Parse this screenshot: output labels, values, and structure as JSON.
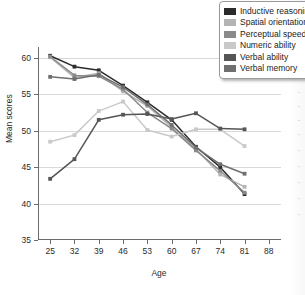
{
  "chart_data": {
    "type": "line",
    "title": "",
    "xlabel": "Age",
    "ylabel": "Mean scores",
    "xlim": [
      21.5,
      91.5
    ],
    "ylim": [
      35,
      61.5
    ],
    "ytick_values": [
      35,
      40,
      45,
      50,
      55,
      60
    ],
    "ytick_labels": [
      "35",
      "40",
      "45",
      "50",
      "55",
      "60"
    ],
    "xtick_values": [
      25,
      32,
      39,
      46,
      53,
      60,
      67,
      74,
      81,
      88
    ],
    "xtick_labels": [
      "25",
      "32",
      "39",
      "46",
      "53",
      "60",
      "67",
      "74",
      "81",
      "88"
    ],
    "x": [
      25,
      32,
      39,
      46,
      53,
      60,
      67,
      74,
      81
    ],
    "grid": "horizontal",
    "legend_position": "top-right",
    "markers": "filled-square",
    "series": [
      {
        "name": "Inductive reasoning",
        "color": "#2b2b2b",
        "values": [
          60.3,
          58.8,
          58.3,
          56.2,
          53.9,
          51.5,
          47.8,
          45.0,
          41.3
        ]
      },
      {
        "name": "Spatial orientation",
        "color": "#b4b4b4",
        "values": [
          60.1,
          57.3,
          57.9,
          55.4,
          53.4,
          50.5,
          47.5,
          44.0,
          42.3
        ]
      },
      {
        "name": "Perceptual speed",
        "color": "#8a8a8a",
        "values": [
          60.2,
          57.6,
          57.5,
          55.7,
          52.5,
          50.3,
          47.3,
          44.5,
          41.5
        ]
      },
      {
        "name": "Numeric ability",
        "color": "#c9c9c9",
        "values": [
          48.5,
          49.4,
          52.7,
          54.0,
          50.1,
          49.2,
          50.2,
          50.2,
          47.9
        ]
      },
      {
        "name": "Verbal ability",
        "color": "#555555",
        "values": [
          43.4,
          46.1,
          51.5,
          52.2,
          52.3,
          51.6,
          52.4,
          50.3,
          50.2
        ]
      },
      {
        "name": "Verbal memory",
        "color": "#6f6f6f",
        "values": [
          57.4,
          57.1,
          57.7,
          56.0,
          53.6,
          50.8,
          47.7,
          45.4,
          44.1
        ]
      }
    ]
  }
}
